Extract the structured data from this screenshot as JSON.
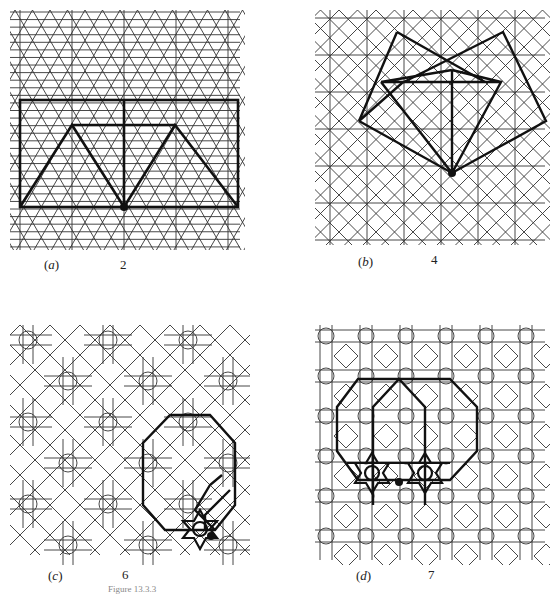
{
  "figure": {
    "caption_partial": "Figure 13.3.3",
    "panels": [
      {
        "id": "a",
        "label": "(a)",
        "symmetry_number": "2",
        "description": "Triangular grid lattice with bold rectangle and two triangles showing 2-fold center"
      },
      {
        "id": "b",
        "label": "(b)",
        "symmetry_number": "4",
        "description": "Square/diagonal lattice with bold squares showing 4-fold center"
      },
      {
        "id": "c",
        "label": "(c)",
        "symmetry_number": "6",
        "description": "Star-cross pattern with bold octagon and star showing 6-fold center"
      },
      {
        "id": "d",
        "label": "(d)",
        "symmetry_number": "7",
        "description": "Grid pattern with circles and diamonds, bold octagons and two stars showing center 7"
      }
    ]
  },
  "colors": {
    "line": "#2a2a2a",
    "bold": "#111111",
    "background": "#ffffff"
  }
}
